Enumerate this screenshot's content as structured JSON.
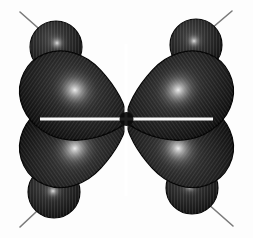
{
  "figure": {
    "title": "d-orbital isosurface (four-lobe, dxy type)",
    "background_color": "#fdfdfd",
    "width": 253,
    "height": 238,
    "center": {
      "x": 126.5,
      "y": 119.0
    },
    "surface_colors": {
      "lobe_fill_dark": "#151515",
      "lobe_fill_mid": "#2c2c2c",
      "lobe_fill_light": "#3b3b3b",
      "lobe_edge": "#050505",
      "highlight_core": "#f2f2f2",
      "highlight_mid": "#8e8e8e",
      "axis_line": "#7a7a7a",
      "waist_gap": "#ffffff"
    },
    "render_style": {
      "shading": "radial-specular",
      "texture": "vertical-scanline-striping",
      "stripe_opacity": 0.1,
      "outline_width": 1.2
    }
  },
  "lobes": {
    "label": "large-inner-lobes",
    "count": 4,
    "shape": "teardrop-converging-at-origin",
    "span_x": [
      55,
      198
    ],
    "span_y": [
      45,
      195
    ],
    "items": [
      {
        "name": "lobe-top-left",
        "quadrant": "top-left",
        "tip": {
          "x": 124,
          "y": 117
        },
        "highlight": {
          "x": 91,
          "y": 82,
          "r": 20
        },
        "rotation_deg": 0
      },
      {
        "name": "lobe-top-right",
        "quadrant": "top-right",
        "tip": {
          "x": 129,
          "y": 117
        },
        "highlight": {
          "x": 163,
          "y": 80,
          "r": 20
        },
        "rotation_deg": 90
      },
      {
        "name": "lobe-bottom-left",
        "quadrant": "bottom-left",
        "tip": {
          "x": 124,
          "y": 122
        },
        "highlight": {
          "x": 88,
          "y": 156,
          "r": 20
        },
        "rotation_deg": 270
      },
      {
        "name": "lobe-bottom-right",
        "quadrant": "bottom-right",
        "tip": {
          "x": 129,
          "y": 122
        },
        "highlight": {
          "x": 165,
          "y": 160,
          "r": 20
        },
        "rotation_deg": 180
      }
    ]
  },
  "spheres": {
    "label": "outer-small-lobes",
    "count": 4,
    "shape": "sphere",
    "radius": 26,
    "items": [
      {
        "name": "sphere-top-left",
        "quadrant": "top-left",
        "center": {
          "x": 56,
          "y": 47
        },
        "highlight": {
          "x": 57,
          "y": 43,
          "r": 11
        }
      },
      {
        "name": "sphere-top-right",
        "quadrant": "top-right",
        "center": {
          "x": 196,
          "y": 45
        },
        "highlight": {
          "x": 194,
          "y": 41,
          "r": 11
        }
      },
      {
        "name": "sphere-bottom-left",
        "quadrant": "bottom-left",
        "center": {
          "x": 54,
          "y": 192
        },
        "highlight": {
          "x": 53,
          "y": 191,
          "r": 11
        }
      },
      {
        "name": "sphere-bottom-right",
        "quadrant": "bottom-right",
        "center": {
          "x": 192,
          "y": 188
        },
        "highlight": {
          "x": 190,
          "y": 186,
          "r": 11
        }
      }
    ]
  },
  "axes": {
    "label": "bond-axis-sticks",
    "count": 4,
    "stroke_color": "#7a7a7a",
    "stroke_width": 1.6,
    "items": [
      {
        "name": "axis-line-top-left",
        "from": {
          "x": 20,
          "y": 12
        },
        "to": {
          "x": 52,
          "y": 40
        }
      },
      {
        "name": "axis-line-top-right",
        "from": {
          "x": 232,
          "y": 11
        },
        "to": {
          "x": 200,
          "y": 38
        }
      },
      {
        "name": "axis-line-bottom-left",
        "from": {
          "x": 20,
          "y": 227
        },
        "to": {
          "x": 50,
          "y": 199
        }
      },
      {
        "name": "axis-line-bottom-right",
        "from": {
          "x": 233,
          "y": 226
        },
        "to": {
          "x": 201,
          "y": 198
        }
      }
    ]
  },
  "nodal_planes": {
    "label": "central-nodal-cross",
    "description": "bright white gap separating the four lobes at the origin",
    "horizontal_gap_y": 119,
    "vertical_gap_x": 126,
    "gap_width": 3
  }
}
